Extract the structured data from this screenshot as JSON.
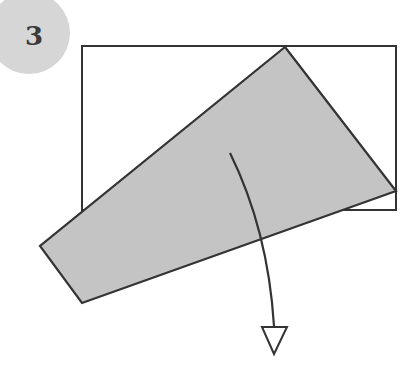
{
  "step": {
    "number": "3"
  },
  "colors": {
    "badge": "#d6d6d6",
    "stroke": "#333333",
    "fold_fill": "#c4c4c4",
    "paper_fill": "#ffffff"
  },
  "diagram": {
    "type": "folding-instruction",
    "rectangle": {
      "x": 82,
      "y": 46,
      "width": 314,
      "height": 164
    },
    "folded_flap_points": [
      [
        285,
        47
      ],
      [
        396,
        191
      ],
      [
        82,
        303
      ],
      [
        40,
        246
      ],
      [
        82,
        210
      ]
    ],
    "arrow": {
      "start": [
        230,
        153
      ],
      "end": [
        274,
        326
      ],
      "head_tip": [
        274,
        354
      ]
    }
  }
}
